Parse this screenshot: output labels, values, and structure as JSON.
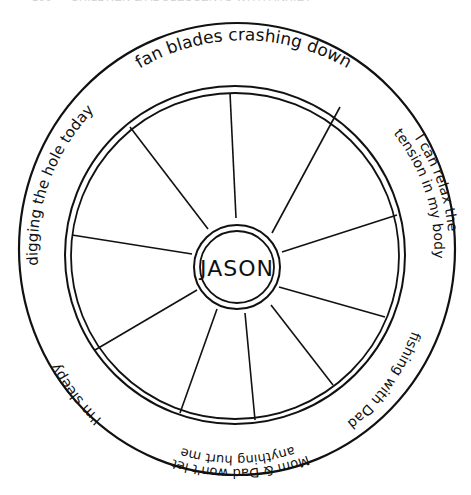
{
  "page_header": "166 — CHILDREN & ADOLESCENTS WITH ANXIETY DISORDERS",
  "wheel": {
    "center_label": "JASON",
    "segment_count": 10,
    "outer_ring_phrases": [
      {
        "id": "top",
        "text": "fan blades crashing down"
      },
      {
        "id": "right-upper",
        "line1": "I can relax the",
        "line2": "tension in my body"
      },
      {
        "id": "right-lower",
        "text": "fishing with Dad"
      },
      {
        "id": "bottom",
        "line1": "Mom & Dad won't let",
        "line2": "anything hurt me"
      },
      {
        "id": "left-lower",
        "text": "I'm sleepy"
      },
      {
        "id": "left-upper",
        "text": "digging the hole today"
      }
    ]
  },
  "colors": {
    "ink": "#111111",
    "paper": "#ffffff"
  }
}
